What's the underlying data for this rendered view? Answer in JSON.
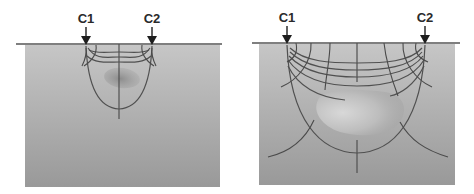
{
  "panels": [
    {
      "id": "narrow-spacing",
      "electrodes": [
        {
          "label": "C1",
          "x": 86
        },
        {
          "label": "C2",
          "x": 152
        }
      ]
    },
    {
      "id": "wide-spacing",
      "electrodes": [
        {
          "label": "C1",
          "x": 287
        },
        {
          "label": "C2",
          "x": 425
        }
      ]
    }
  ],
  "colors": {
    "ground_top": "#c4c4c4",
    "ground_bottom": "#9a9a9a",
    "surface_line": "#555555",
    "field_lines": "#505050",
    "target_body": "#8a8a8a",
    "target_highlight": "#d6d6d6",
    "arrow": "#1e1e1e"
  }
}
